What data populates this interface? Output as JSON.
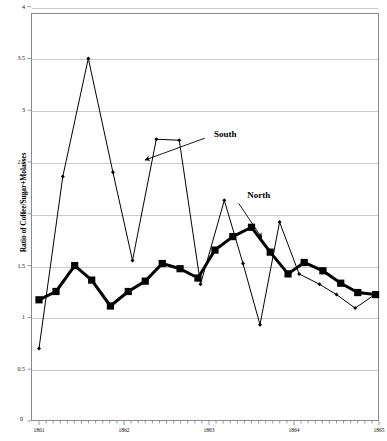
{
  "chart_data": {
    "type": "line",
    "title": "",
    "xlabel": "",
    "ylabel": "Ratio of Coffee/Sugar+Molasses",
    "xlim": [
      1861.0,
      1865.0
    ],
    "ylim": [
      0,
      4
    ],
    "yticks": [
      0,
      0.5,
      1,
      1.5,
      2,
      2.5,
      3,
      3.5,
      4
    ],
    "ytick_labels": [
      "0",
      "0.5",
      "1",
      "1.5",
      "2",
      "2.5",
      "3",
      "3.5",
      "4"
    ],
    "xticks": [
      1861,
      1862,
      1863,
      1864,
      1865
    ],
    "xtick_labels": [
      "1861",
      "1862",
      "1863",
      "1864",
      "1865"
    ],
    "grid": "horizontal",
    "legend_position": "inline-annotations",
    "annotations": [
      {
        "label": "South",
        "x": 1863.06,
        "y": 2.76
      },
      {
        "label": "North",
        "x": 1863.45,
        "y": 2.17
      }
    ],
    "series": [
      {
        "name": "South",
        "marker": "diamond",
        "line_width": 1,
        "color": "#000000",
        "x": [
          1861.0,
          1861.28,
          1861.58,
          1861.87,
          1862.1,
          1862.38,
          1862.65,
          1862.9,
          1863.18,
          1863.4,
          1863.6,
          1863.83,
          1864.06,
          1864.3,
          1864.5,
          1864.72,
          1864.95
        ],
        "y": [
          0.7,
          2.36,
          3.5,
          2.4,
          1.55,
          2.72,
          2.71,
          1.32,
          2.13,
          1.52,
          0.93,
          1.92,
          1.42,
          1.32,
          1.22,
          1.09,
          1.22
        ]
      },
      {
        "name": "North",
        "marker": "square",
        "line_width": 3,
        "color": "#000000",
        "x": [
          1861.0,
          1861.2,
          1861.42,
          1861.62,
          1861.84,
          1862.05,
          1862.25,
          1862.45,
          1862.66,
          1862.87,
          1863.07,
          1863.28,
          1863.5,
          1863.72,
          1863.93,
          1864.12,
          1864.34,
          1864.55,
          1864.75,
          1864.96
        ],
        "y": [
          1.17,
          1.25,
          1.5,
          1.36,
          1.11,
          1.25,
          1.35,
          1.52,
          1.47,
          1.38,
          1.65,
          1.78,
          1.87,
          1.63,
          1.42,
          1.53,
          1.45,
          1.33,
          1.24,
          1.22
        ]
      }
    ]
  },
  "axes": {
    "y_axis_title": "Ratio of Coffee/Sugar+Molasses",
    "origin_label": "0"
  }
}
